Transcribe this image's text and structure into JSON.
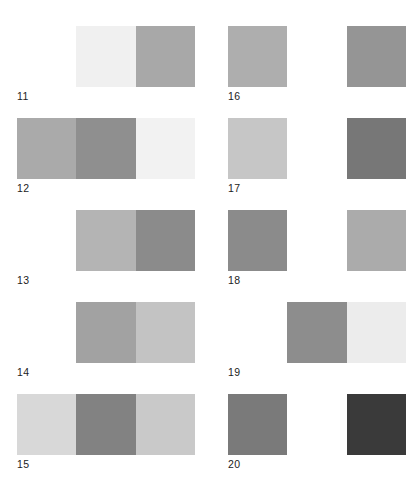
{
  "figure": {
    "background_color": "#ffffff",
    "label_color": "#1c1c1c",
    "columns": 2,
    "rows": 5,
    "swatches_per_plate": 3
  },
  "plates": [
    {
      "label": "11",
      "swatches": [
        {
          "name": "swatch-left",
          "color": "#ffffff"
        },
        {
          "name": "swatch-middle",
          "color": "#f0f0f0"
        },
        {
          "name": "swatch-right",
          "color": "#a8a8a8"
        }
      ]
    },
    {
      "label": "16",
      "swatches": [
        {
          "name": "swatch-left",
          "color": "#aeaeae"
        },
        {
          "name": "swatch-middle",
          "color": "#ffffff"
        },
        {
          "name": "swatch-right",
          "color": "#959595"
        }
      ]
    },
    {
      "label": "12",
      "swatches": [
        {
          "name": "swatch-left",
          "color": "#aaaaaa"
        },
        {
          "name": "swatch-middle",
          "color": "#8f8f8f"
        },
        {
          "name": "swatch-right",
          "color": "#f2f2f2"
        }
      ]
    },
    {
      "label": "17",
      "swatches": [
        {
          "name": "swatch-left",
          "color": "#c6c6c6"
        },
        {
          "name": "swatch-middle",
          "color": "#ffffff"
        },
        {
          "name": "swatch-right",
          "color": "#777777"
        }
      ]
    },
    {
      "label": "13",
      "swatches": [
        {
          "name": "swatch-left",
          "color": "#ffffff"
        },
        {
          "name": "swatch-middle",
          "color": "#b4b4b4"
        },
        {
          "name": "swatch-right",
          "color": "#8b8b8b"
        }
      ]
    },
    {
      "label": "18",
      "swatches": [
        {
          "name": "swatch-left",
          "color": "#8b8b8b"
        },
        {
          "name": "swatch-middle",
          "color": "#ffffff"
        },
        {
          "name": "swatch-right",
          "color": "#ababab"
        }
      ]
    },
    {
      "label": "14",
      "swatches": [
        {
          "name": "swatch-left",
          "color": "#ffffff"
        },
        {
          "name": "swatch-middle",
          "color": "#a2a2a2"
        },
        {
          "name": "swatch-right",
          "color": "#c3c3c3"
        }
      ]
    },
    {
      "label": "19",
      "swatches": [
        {
          "name": "swatch-left",
          "color": "#ffffff"
        },
        {
          "name": "swatch-middle",
          "color": "#8d8d8d"
        },
        {
          "name": "swatch-right",
          "color": "#ececec"
        }
      ]
    },
    {
      "label": "15",
      "swatches": [
        {
          "name": "swatch-left",
          "color": "#d8d8d8"
        },
        {
          "name": "swatch-middle",
          "color": "#828282"
        },
        {
          "name": "swatch-right",
          "color": "#c9c9c9"
        }
      ]
    },
    {
      "label": "20",
      "swatches": [
        {
          "name": "swatch-left",
          "color": "#7a7a7a"
        },
        {
          "name": "swatch-middle",
          "color": "#ffffff"
        },
        {
          "name": "swatch-right",
          "color": "#3a3a3a"
        }
      ]
    }
  ]
}
